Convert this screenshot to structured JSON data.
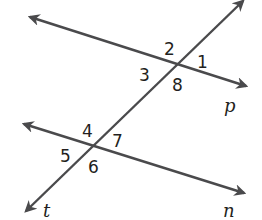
{
  "diagram": {
    "type": "parallel lines cut by transversal",
    "colors": {
      "line": "#4a4a4c",
      "text": "#231f20",
      "background": "#ffffff"
    },
    "lines": [
      {
        "id": "p",
        "label": "p",
        "x1": 30,
        "y1": 17,
        "x2": 246,
        "y2": 86
      },
      {
        "id": "n",
        "label": "n",
        "x1": 24,
        "y1": 124,
        "x2": 244,
        "y2": 193
      },
      {
        "id": "t",
        "label": "t",
        "x1": 243,
        "y1": 1,
        "x2": 26,
        "y2": 211
      }
    ],
    "angle_labels": [
      {
        "id": "a1",
        "text": "1",
        "x": 197,
        "y": 68
      },
      {
        "id": "a2",
        "text": "2",
        "x": 164,
        "y": 55
      },
      {
        "id": "a3",
        "text": "3",
        "x": 139,
        "y": 81
      },
      {
        "id": "a8",
        "text": "8",
        "x": 172,
        "y": 91
      },
      {
        "id": "a4",
        "text": "4",
        "x": 82,
        "y": 137
      },
      {
        "id": "a7",
        "text": "7",
        "x": 112,
        "y": 147
      },
      {
        "id": "a5",
        "text": "5",
        "x": 60,
        "y": 162
      },
      {
        "id": "a6",
        "text": "6",
        "x": 88,
        "y": 173
      }
    ],
    "line_labels": [
      {
        "text": "p",
        "x": 224,
        "y": 112
      },
      {
        "text": "n",
        "x": 223,
        "y": 217
      },
      {
        "text": "t",
        "x": 43,
        "y": 217
      }
    ]
  }
}
